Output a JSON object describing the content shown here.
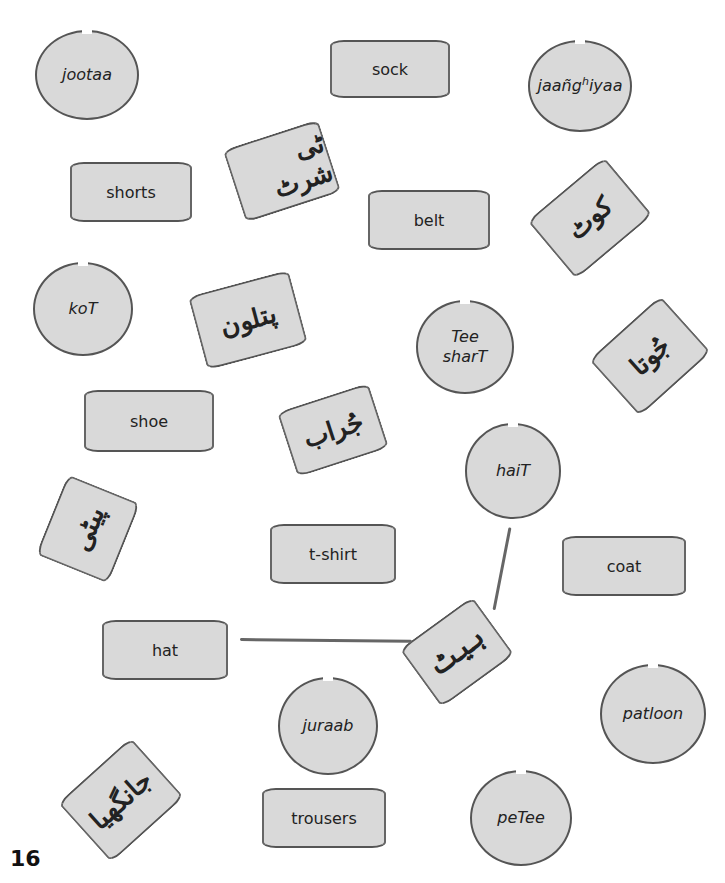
{
  "page_number": "16",
  "circles": [
    {
      "id": "jootaa",
      "text": "jootaa"
    },
    {
      "id": "jaanghiyaa",
      "text_main": "jaañg",
      "text_sup": "h",
      "text_end": "iyaa"
    },
    {
      "id": "kot",
      "text": "koT"
    },
    {
      "id": "tee-shart",
      "line1": "Tee",
      "line2": "sharT"
    },
    {
      "id": "hait",
      "text": "haiT"
    },
    {
      "id": "juraab",
      "text": "juraab"
    },
    {
      "id": "patloon",
      "text": "patloon"
    },
    {
      "id": "petee",
      "text": "peTee"
    }
  ],
  "english_cards": [
    {
      "id": "sock",
      "text": "sock"
    },
    {
      "id": "shorts",
      "text": "shorts"
    },
    {
      "id": "belt",
      "text": "belt"
    },
    {
      "id": "shoe",
      "text": "shoe"
    },
    {
      "id": "t-shirt",
      "text": "t-shirt"
    },
    {
      "id": "coat",
      "text": "coat"
    },
    {
      "id": "hat",
      "text": "hat"
    },
    {
      "id": "trousers",
      "text": "trousers"
    }
  ],
  "urdu_cards": [
    {
      "id": "tshirt-urdu",
      "text": "ٹی شرٹ"
    },
    {
      "id": "coat-urdu",
      "text": "کوٹ"
    },
    {
      "id": "patloon-urdu",
      "text": "پتلون"
    },
    {
      "id": "joota-urdu",
      "text": "جُوتا"
    },
    {
      "id": "juraab-urdu",
      "text": "جُراب"
    },
    {
      "id": "petee-urdu",
      "text": "پیٹی"
    },
    {
      "id": "hait-urdu",
      "text": "ہیٹ"
    },
    {
      "id": "jaanghiya-urdu",
      "text": "جانگھیا"
    }
  ],
  "connections": [
    {
      "from": "hat",
      "to": "hait-urdu"
    },
    {
      "from": "hait-urdu",
      "to": "hait"
    }
  ]
}
